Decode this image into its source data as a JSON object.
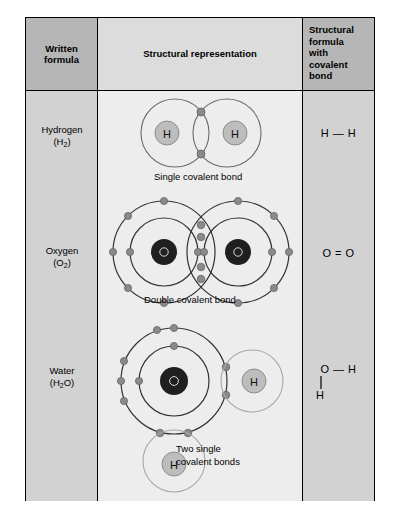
{
  "table": {
    "headers": {
      "written_formula": "Written\nformula",
      "structural_representation": "Structural representation",
      "structural_formula_covalent": "Structural\nformula\nwith\ncovalent\nbond"
    },
    "header_written_line1": "Written",
    "header_written_line2": "formula",
    "header_struct": "Structural representation",
    "header_formula_line1": "Structural",
    "header_formula_line2": "formula",
    "header_formula_line3": "with",
    "header_formula_line4": "covalent",
    "header_formula_line5": "bond"
  },
  "rows": [
    {
      "id": "hydrogen",
      "name_line1": "Hydrogen",
      "name_line2": "(H₂)",
      "name_base": "Hydrogen",
      "name_formula": "H",
      "name_subscript": "2",
      "caption": "Single covalent bond",
      "structural_formula": "H — H",
      "bond_type": "single",
      "atoms": [
        {
          "symbol": "H",
          "shells": 1,
          "electrons_shared": 2
        },
        {
          "symbol": "H",
          "shells": 1,
          "electrons_shared": 2
        }
      ]
    },
    {
      "id": "oxygen",
      "name_line1": "Oxygen",
      "name_line2": "(O₂)",
      "name_base": "Oxygen",
      "name_formula": "O",
      "name_subscript": "2",
      "caption": "Double covalent bond",
      "structural_formula": "O = O",
      "bond_type": "double",
      "atoms": [
        {
          "symbol": "O",
          "shells": 2,
          "electrons_shared": 4
        },
        {
          "symbol": "O",
          "shells": 2,
          "electrons_shared": 4
        }
      ]
    },
    {
      "id": "water",
      "name_line1": "Water",
      "name_line2": "(H₂O)",
      "name_base": "Water",
      "name_formula_a": "H",
      "name_subscript": "2",
      "name_formula_b": "O",
      "caption_line1": "Two single",
      "caption_line2": "covalent bonds",
      "structural_formula_line1": "O — H",
      "structural_formula_line2": "H",
      "bond_type": "two-single",
      "atoms": [
        {
          "symbol": "O",
          "shells": 2
        },
        {
          "symbol": "H",
          "shells": 1
        },
        {
          "symbol": "H",
          "shells": 1
        }
      ]
    }
  ],
  "colors": {
    "header_dark_gray": "#b6b6b6",
    "header_light_gray": "#dcdcdc",
    "column_gray": "#d2d2d2",
    "panel_gray": "#ededed",
    "border": "#000000",
    "shell_line": "#555555",
    "shell_line_light": "#999999",
    "electron_dot": "#8a8a8a",
    "hydrogen_nucleus": "#b8b8b8",
    "oxygen_nucleus": "#2b2b2b",
    "text": "#000000"
  }
}
